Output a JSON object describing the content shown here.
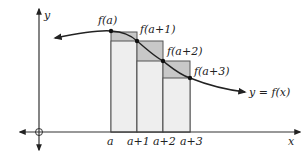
{
  "diagram": {
    "axes": {
      "x_label": "x",
      "y_label": "y",
      "origin_marker": "circle"
    },
    "curve_label": "y = f(x)",
    "point_labels": [
      "f(a)",
      "f(a+1)",
      "f(a+2)",
      "f(a+3)"
    ],
    "tick_labels": [
      "a",
      "a+1",
      "a+2",
      "a+3"
    ],
    "colors": {
      "axis": "#333333",
      "curve": "#222222",
      "rect_light": "#eeeeee",
      "rect_dark": "#c8c8c8",
      "rect_border": "#555555"
    }
  }
}
